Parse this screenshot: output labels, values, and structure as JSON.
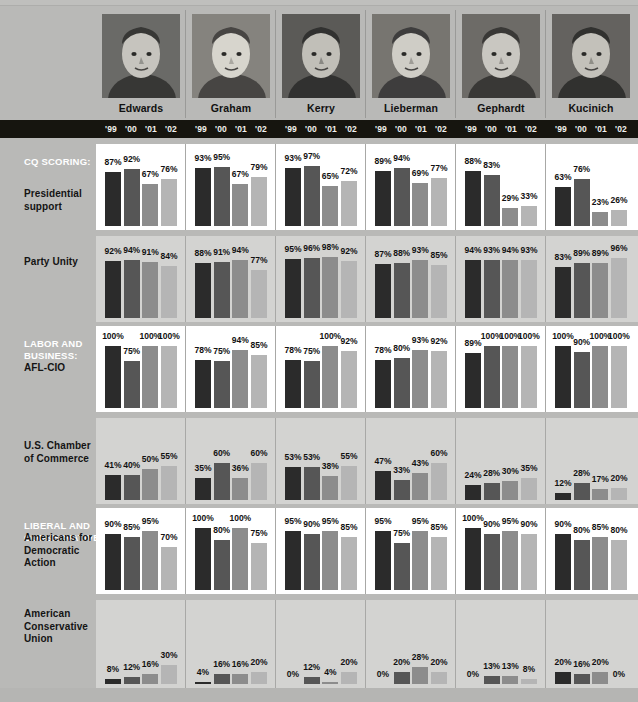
{
  "meta": {
    "years": [
      "'99",
      "'00",
      "'01",
      "'02"
    ],
    "bar_colors": [
      "#2b2b2b",
      "#565656",
      "#8c8c8c",
      "#b5b5b5"
    ],
    "page_background": "#b9b9b7",
    "yearbar_background": "#16150f",
    "section_label_color": "#ffffff",
    "row_label_color": "#141414"
  },
  "candidates": [
    {
      "name": "Edwards"
    },
    {
      "name": "Graham"
    },
    {
      "name": "Kerry"
    },
    {
      "name": "Lieberman"
    },
    {
      "name": "Gephardt"
    },
    {
      "name": "Kucinich"
    }
  ],
  "sections": [
    {
      "title": "CQ SCORING:",
      "row_index": 0
    },
    {
      "title": "LABOR AND BUSINESS:",
      "row_index": 2
    },
    {
      "title": "LIBERAL AND CONSERVATIVE:",
      "row_index": 4
    }
  ],
  "rows": [
    {
      "label": "Presidential support",
      "band": "white"
    },
    {
      "label": "Party Unity",
      "band": "gray"
    },
    {
      "label": "AFL-CIO",
      "band": "white"
    },
    {
      "label": "U.S. Chamber of Commerce",
      "band": "gray"
    },
    {
      "label": "Americans for Democratic Action",
      "band": "white"
    },
    {
      "label": "American Conservative Union",
      "band": "gray"
    }
  ],
  "chart_data": {
    "type": "bar",
    "xlabel": "Year",
    "ylabel": "Rating (%)",
    "ylim": [
      0,
      100
    ],
    "grid": false,
    "legend_position": "none",
    "categories": [
      "'99",
      "'00",
      "'01",
      "'02"
    ],
    "group_labels": [
      "Edwards",
      "Graham",
      "Kerry",
      "Lieberman",
      "Gephardt",
      "Kucinich"
    ],
    "panels": [
      {
        "metric": "Presidential support",
        "section": "CQ SCORING:",
        "series": [
          {
            "name": "Edwards",
            "values": [
              87,
              92,
              67,
              76
            ],
            "labels": [
              "87%",
              "92%",
              "67%",
              "76%"
            ]
          },
          {
            "name": "Graham",
            "values": [
              93,
              95,
              67,
              79
            ],
            "labels": [
              "93%",
              "95%",
              "67%",
              "79%"
            ]
          },
          {
            "name": "Kerry",
            "values": [
              93,
              97,
              65,
              72
            ],
            "labels": [
              "93%",
              "97%",
              "65%",
              "72%"
            ]
          },
          {
            "name": "Lieberman",
            "values": [
              89,
              94,
              69,
              77
            ],
            "labels": [
              "89%",
              "94%",
              "69%",
              "77%"
            ]
          },
          {
            "name": "Gephardt",
            "values": [
              88,
              83,
              29,
              33
            ],
            "labels": [
              "88%",
              "83%",
              "29%",
              "33%"
            ]
          },
          {
            "name": "Kucinich",
            "values": [
              63,
              76,
              23,
              26
            ],
            "labels": [
              "63%",
              "76%",
              "23%",
              "26%"
            ]
          }
        ]
      },
      {
        "metric": "Party Unity",
        "section": "CQ SCORING:",
        "series": [
          {
            "name": "Edwards",
            "values": [
              92,
              94,
              91,
              84
            ],
            "labels": [
              "92%",
              "94%",
              "91%",
              "84%"
            ]
          },
          {
            "name": "Graham",
            "values": [
              88,
              91,
              94,
              77
            ],
            "labels": [
              "88%",
              "91%",
              "94%",
              "77%"
            ]
          },
          {
            "name": "Kerry",
            "values": [
              95,
              96,
              98,
              92
            ],
            "labels": [
              "95%",
              "96%",
              "98%",
              "92%"
            ]
          },
          {
            "name": "Lieberman",
            "values": [
              87,
              88,
              93,
              85
            ],
            "labels": [
              "87%",
              "88%",
              "93%",
              "85%"
            ]
          },
          {
            "name": "Gephardt",
            "values": [
              94,
              93,
              94,
              93
            ],
            "labels": [
              "94%",
              "93%",
              "94%",
              "93%"
            ]
          },
          {
            "name": "Kucinich",
            "values": [
              83,
              89,
              89,
              96
            ],
            "labels": [
              "83%",
              "89%",
              "89%",
              "96%"
            ]
          }
        ]
      },
      {
        "metric": "AFL-CIO",
        "section": "LABOR AND BUSINESS:",
        "series": [
          {
            "name": "Edwards",
            "values": [
              100,
              75,
              100,
              100
            ],
            "labels": [
              "100%",
              "75%",
              "100%",
              "100%"
            ]
          },
          {
            "name": "Graham",
            "values": [
              78,
              75,
              94,
              85
            ],
            "labels": [
              "78%",
              "75%",
              "94%",
              "85%"
            ]
          },
          {
            "name": "Kerry",
            "values": [
              78,
              75,
              100,
              92
            ],
            "labels": [
              "78%",
              "75%",
              "100%",
              "92%"
            ]
          },
          {
            "name": "Lieberman",
            "values": [
              78,
              80,
              93,
              92
            ],
            "labels": [
              "78%",
              "80%",
              "93%",
              "92%"
            ]
          },
          {
            "name": "Gephardt",
            "values": [
              89,
              100,
              100,
              100
            ],
            "labels": [
              "89%",
              "100%",
              "100%",
              "100%"
            ]
          },
          {
            "name": "Kucinich",
            "values": [
              100,
              90,
              100,
              100
            ],
            "labels": [
              "100%",
              "90%",
              "100%",
              "100%"
            ]
          }
        ]
      },
      {
        "metric": "U.S. Chamber of Commerce",
        "section": "LABOR AND BUSINESS:",
        "series": [
          {
            "name": "Edwards",
            "values": [
              41,
              40,
              50,
              55
            ],
            "labels": [
              "41%",
              "40%",
              "50%",
              "55%"
            ]
          },
          {
            "name": "Graham",
            "values": [
              35,
              60,
              36,
              60
            ],
            "labels": [
              "35%",
              "60%",
              "36%",
              "60%"
            ]
          },
          {
            "name": "Kerry",
            "values": [
              53,
              53,
              38,
              55
            ],
            "labels": [
              "53%",
              "53%",
              "38%",
              "55%"
            ]
          },
          {
            "name": "Lieberman",
            "values": [
              47,
              33,
              43,
              60
            ],
            "labels": [
              "47%",
              "33%",
              "43%",
              "60%"
            ]
          },
          {
            "name": "Gephardt",
            "values": [
              24,
              28,
              30,
              35
            ],
            "labels": [
              "24%",
              "28%",
              "30%",
              "35%"
            ]
          },
          {
            "name": "Kucinich",
            "values": [
              12,
              28,
              17,
              20
            ],
            "labels": [
              "12%",
              "28%",
              "17%",
              "20%"
            ]
          }
        ]
      },
      {
        "metric": "Americans for Democratic Action",
        "section": "LIBERAL AND CONSERVATIVE:",
        "series": [
          {
            "name": "Edwards",
            "values": [
              90,
              85,
              95,
              70
            ],
            "labels": [
              "90%",
              "85%",
              "95%",
              "70%"
            ]
          },
          {
            "name": "Graham",
            "values": [
              100,
              80,
              100,
              75
            ],
            "labels": [
              "100%",
              "80%",
              "100%",
              "75%"
            ]
          },
          {
            "name": "Kerry",
            "values": [
              95,
              90,
              95,
              85
            ],
            "labels": [
              "95%",
              "90%",
              "95%",
              "85%"
            ]
          },
          {
            "name": "Lieberman",
            "values": [
              95,
              75,
              95,
              85
            ],
            "labels": [
              "95%",
              "75%",
              "95%",
              "85%"
            ]
          },
          {
            "name": "Gephardt",
            "values": [
              100,
              90,
              95,
              90
            ],
            "labels": [
              "100%",
              "90%",
              "95%",
              "90%"
            ]
          },
          {
            "name": "Kucinich",
            "values": [
              90,
              80,
              85,
              80
            ],
            "labels": [
              "90%",
              "80%",
              "85%",
              "80%"
            ]
          }
        ]
      },
      {
        "metric": "American Conservative Union",
        "section": "LIBERAL AND CONSERVATIVE:",
        "series": [
          {
            "name": "Edwards",
            "values": [
              8,
              12,
              16,
              30
            ],
            "labels": [
              "8%",
              "12%",
              "16%",
              "30%"
            ]
          },
          {
            "name": "Graham",
            "values": [
              4,
              16,
              16,
              20
            ],
            "labels": [
              "4%",
              "16%",
              "16%",
              "20%"
            ]
          },
          {
            "name": "Kerry",
            "values": [
              0,
              12,
              4,
              20
            ],
            "labels": [
              "0%",
              "12%",
              "4%",
              "20%"
            ]
          },
          {
            "name": "Lieberman",
            "values": [
              0,
              20,
              28,
              20
            ],
            "labels": [
              "0%",
              "20%",
              "28%",
              "20%"
            ]
          },
          {
            "name": "Gephardt",
            "values": [
              0,
              13,
              13,
              8
            ],
            "labels": [
              "0%",
              "13%",
              "13%",
              "8%"
            ]
          },
          {
            "name": "Kucinich",
            "values": [
              20,
              16,
              20,
              0
            ],
            "labels": [
              "20%",
              "16%",
              "20%",
              "0%"
            ]
          }
        ]
      }
    ]
  }
}
